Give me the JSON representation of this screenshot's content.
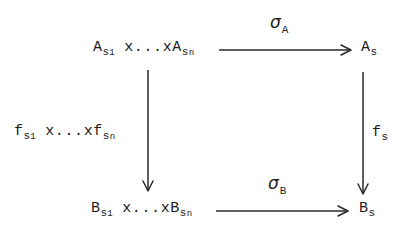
{
  "figure": {
    "kind": "commutative-diagram",
    "ink_color": "#1d1d1d",
    "background_color": "#ffffff"
  },
  "nodes": {
    "top_left": {
      "name": "A-product-node",
      "base1": "A",
      "sub1": "s",
      "sub1_sub": "1",
      "middle": " x...xA",
      "base2_sub": "s",
      "base2_sub_sub": "n",
      "plain_text": "A_{s_1} x...x A_{s_n}"
    },
    "top_right": {
      "name": "A-s-node",
      "base": "A",
      "sub": "s",
      "plain_text": "A_s"
    },
    "bottom_left": {
      "name": "B-product-node",
      "base1": "B",
      "sub1": "s",
      "sub1_sub": "1",
      "middle": " x...xB",
      "base2_sub": "s",
      "base2_sub_sub": "n",
      "plain_text": "B_{s_1} x...x B_{s_n}"
    },
    "bottom_right": {
      "name": "B-s-node",
      "base": "B",
      "sub": "s",
      "plain_text": "B_s"
    }
  },
  "arrows": {
    "top": {
      "name": "sigma-A-arrow",
      "direction": "right",
      "label_symbol": "σ",
      "label_sub": "A",
      "plain_text": "sigma_A"
    },
    "bottom": {
      "name": "sigma-B-arrow",
      "direction": "right",
      "label_symbol": "σ",
      "label_sub": "B",
      "plain_text": "sigma_B"
    },
    "left": {
      "name": "f-product-arrow",
      "direction": "down",
      "base1": "f",
      "sub1": "s",
      "sub1_sub": "1",
      "middle": " x...xf",
      "base2_sub": "s",
      "base2_sub_sub": "n",
      "plain_text": "f_{s_1} x...x f_{s_n}"
    },
    "right": {
      "name": "f-s-arrow",
      "direction": "down",
      "base": "f",
      "sub": "s",
      "plain_text": "f_s"
    }
  }
}
